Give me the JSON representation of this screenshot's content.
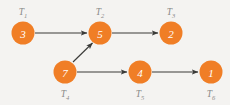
{
  "diagram": {
    "background_color": "#f4f3f1",
    "node_color": "#f07e26",
    "edge_color": "#3a3a38",
    "label_color": "#8a8a88",
    "node_value_color": "#ffffff"
  },
  "nodes": [
    {
      "id": "T1",
      "label_prefix": "T",
      "label_sub": "1",
      "value": "3",
      "cx": 23,
      "cy": 33,
      "r": 11.5,
      "label_x": 23,
      "label_y": 12
    },
    {
      "id": "T2",
      "label_prefix": "T",
      "label_sub": "2",
      "value": "5",
      "cx": 100,
      "cy": 33,
      "r": 11.5,
      "label_x": 100,
      "label_y": 12
    },
    {
      "id": "T3",
      "label_prefix": "T",
      "label_sub": "3",
      "value": "2",
      "cx": 171,
      "cy": 33,
      "r": 11.5,
      "label_x": 171,
      "label_y": 12
    },
    {
      "id": "T4",
      "label_prefix": "T",
      "label_sub": "4",
      "value": "7",
      "cx": 65,
      "cy": 72,
      "r": 11.5,
      "label_x": 65,
      "label_y": 94
    },
    {
      "id": "T5",
      "label_prefix": "T",
      "label_sub": "5",
      "value": "4",
      "cx": 140,
      "cy": 72,
      "r": 11.5,
      "label_x": 140,
      "label_y": 94
    },
    {
      "id": "T6",
      "label_prefix": "T",
      "label_sub": "6",
      "value": "1",
      "cx": 211,
      "cy": 72,
      "r": 11.5,
      "label_x": 211,
      "label_y": 94
    }
  ],
  "edges": [
    {
      "id": "e1",
      "from": "T1",
      "to": "T2",
      "x1": 35,
      "y1": 33,
      "x2": 87,
      "y2": 33
    },
    {
      "id": "e2",
      "from": "T2",
      "to": "T3",
      "x1": 112,
      "y1": 33,
      "x2": 158,
      "y2": 33
    },
    {
      "id": "e3",
      "from": "T4",
      "to": "T2",
      "x1": 73,
      "y1": 62,
      "x2": 92.5,
      "y2": 43
    },
    {
      "id": "e4",
      "from": "T4",
      "to": "T5",
      "x1": 77,
      "y1": 72,
      "x2": 127,
      "y2": 72
    },
    {
      "id": "e5",
      "from": "T5",
      "to": "T6",
      "x1": 152,
      "y1": 72,
      "x2": 198,
      "y2": 72
    }
  ]
}
